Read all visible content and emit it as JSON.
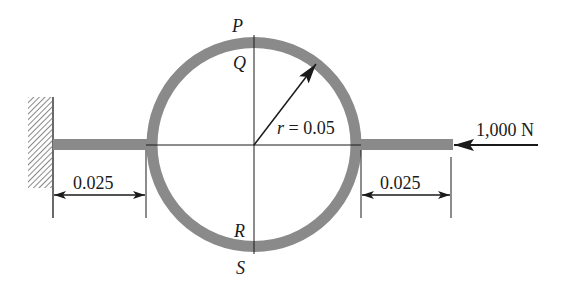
{
  "diagram": {
    "points": {
      "P": "P",
      "Q": "Q",
      "R": "R",
      "S": "S"
    },
    "radius_label": "r = 0.05",
    "left_dimension": "0.025",
    "right_dimension": "0.025",
    "force_label": "1,000 N",
    "colors": {
      "ring": "#8a8a8a",
      "line": "#1a1a1a"
    }
  }
}
